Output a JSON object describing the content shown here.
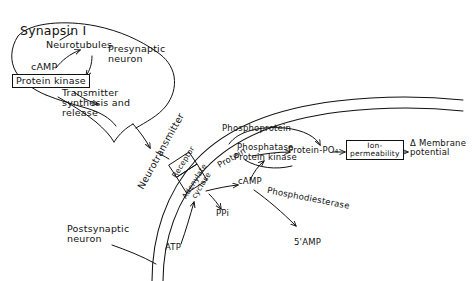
{
  "diagram": {
    "title": "Synapsin I",
    "labels": {
      "neurotubules": "Neurotubules",
      "presynaptic_neuron": "Presynaptic\nneuron",
      "camp_top": "cAMP",
      "protein_kinase_top": "Protein kinase",
      "transmitter_synthesis": "Transmitter\nsynthesis and\nrelease",
      "neurotransmitter": "Neurotransmitter",
      "receptor": "Receptor",
      "adenylate_cyclase": "Adenylate\ncyclase",
      "protein": "Protein",
      "phosphoprotein": "Phosphoprotein",
      "phosphatase": "Phosphatase",
      "protein_kinase_mid": "Protein kinase",
      "protein_po4": "Protein-PO₄",
      "ion_permeability": "Ion-\npermeability",
      "membrane_potential": "Δ Membrane\npotential",
      "camp_mid": "cAMP",
      "phosphodiesterase": "Phosphodiesterase",
      "ppi": "PPi",
      "atp": "ATP",
      "amp": "5'AMP",
      "postsynaptic_neuron": "Postsynaptic\nneuron"
    },
    "colors": {
      "ink": "#111111",
      "paper": "#ffffff"
    }
  }
}
